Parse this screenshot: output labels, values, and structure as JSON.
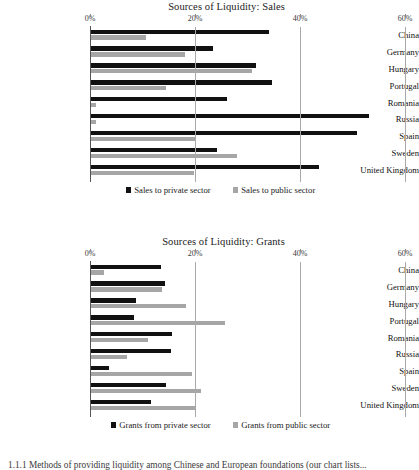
{
  "page": {
    "caption_fragment": "1.1.1 Methods of providing liquidity among Chinese and European foundations (our chart lists..."
  },
  "chart_data": [
    {
      "id": "sales",
      "type": "bar",
      "orientation": "horizontal",
      "title": "Sources of Liquidity: Sales",
      "xlabel": "",
      "ylabel": "",
      "xlim": [
        0,
        60
      ],
      "xticks": [
        0,
        20,
        40,
        60
      ],
      "xtick_labels": [
        "0%",
        "20%",
        "40%",
        "60%"
      ],
      "grid": "vertical",
      "legend_position": "bottom",
      "categories": [
        "China",
        "Germany",
        "Hungary",
        "Portugal",
        "Romania",
        "Russia",
        "Spain",
        "Sweden",
        "United Kingdom"
      ],
      "series": [
        {
          "name": "Sales to private sector",
          "color": "#111111",
          "values": [
            34.1,
            23.4,
            31.6,
            34.7,
            26.1,
            53.1,
            50.8,
            24.1,
            43.6
          ]
        },
        {
          "name": "Sales to public sector",
          "color": "#a6a6a6",
          "values": [
            10.6,
            18.1,
            30.9,
            14.4,
            1.1,
            1.1,
            20.1,
            28.0,
            19.8
          ]
        }
      ]
    },
    {
      "id": "grants",
      "type": "bar",
      "orientation": "horizontal",
      "title": "Sources of Liquidity: Grants",
      "xlabel": "",
      "ylabel": "",
      "xlim": [
        0,
        60
      ],
      "xticks": [
        0,
        20,
        40,
        60
      ],
      "xtick_labels": [
        "0%",
        "20%",
        "40%",
        "60%"
      ],
      "grid": "vertical",
      "legend_position": "bottom",
      "categories": [
        "China",
        "Germany",
        "Hungary",
        "Portugal",
        "Romania",
        "Russia",
        "Spain",
        "Sweden",
        "United Kingdom"
      ],
      "series": [
        {
          "name": "Grants from private sector",
          "color": "#111111",
          "values": [
            13.5,
            14.3,
            8.7,
            8.4,
            15.7,
            15.4,
            3.6,
            14.5,
            11.6
          ]
        },
        {
          "name": "Grants from public sector",
          "color": "#a6a6a6",
          "values": [
            2.7,
            13.7,
            18.3,
            25.7,
            11.1,
            7.0,
            19.5,
            21.1,
            20.0
          ]
        }
      ]
    }
  ]
}
